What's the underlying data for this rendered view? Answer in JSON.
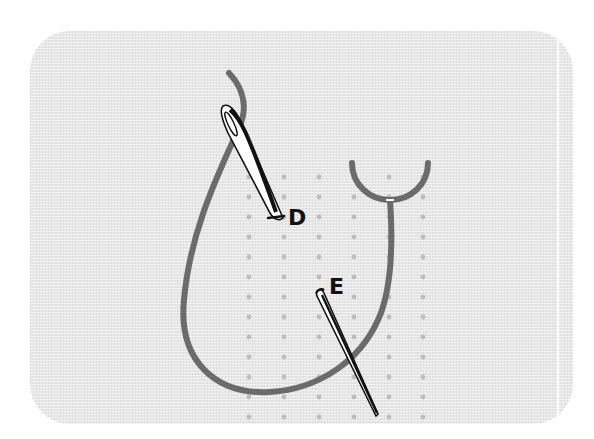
{
  "diagram": {
    "title": "",
    "labels": {
      "d": "D",
      "e": "E"
    },
    "colors": {
      "background": "#ffffff",
      "fabric": "#e6e6e6",
      "thread": "#6b6b6b",
      "dots": "#bdbdbd",
      "needle_outline": "#111111",
      "needle_fill": "#ffffff"
    },
    "grid": {
      "columns_x": [
        249,
        284,
        319,
        354,
        389,
        423
      ],
      "row_start_y": 177,
      "row_spacing": 20,
      "rows": 13
    }
  }
}
